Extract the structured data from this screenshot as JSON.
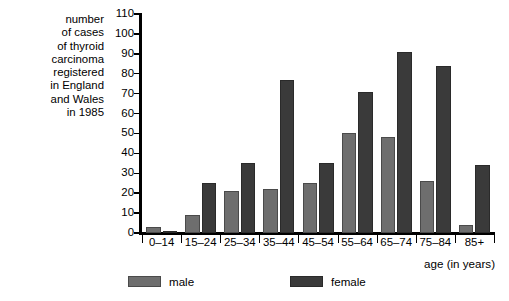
{
  "chart_data": {
    "type": "bar",
    "title": "",
    "ylabel": "number of cases of thyroid carcinoma registered in England and Wales in 1985",
    "xlabel": "age (in years)",
    "categories": [
      "0–14",
      "15–24",
      "25–34",
      "35–44",
      "45–54",
      "55–64",
      "65–74",
      "75–84",
      "85+"
    ],
    "series": [
      {
        "name": "male",
        "color": "#6e6e6e",
        "values": [
          3,
          9,
          21,
          22,
          25,
          50,
          48,
          26,
          4
        ]
      },
      {
        "name": "female",
        "color": "#3a3a3a",
        "values": [
          1,
          25,
          35,
          77,
          35,
          71,
          91,
          84,
          34
        ]
      }
    ],
    "ylim": [
      0,
      110
    ],
    "yticks": [
      0,
      10,
      20,
      30,
      40,
      50,
      60,
      70,
      80,
      90,
      100,
      110
    ],
    "grid": false,
    "legend_position": "bottom"
  },
  "axis": {
    "y_caption": "number\nof cases\nof thyroid\ncarcinoma\nregistered\nin England\nand Wales\nin 1985",
    "x_title": "age (in years)"
  },
  "legend": {
    "entries": [
      {
        "label": "male"
      },
      {
        "label": "female"
      }
    ]
  }
}
